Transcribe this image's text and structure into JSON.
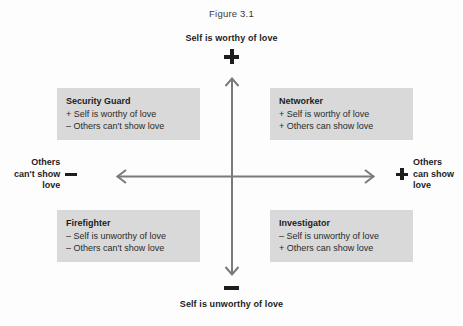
{
  "figure": {
    "title": "Figure 3.1",
    "type": "two-by-two-quadrant-matrix"
  },
  "axes": {
    "vertical": {
      "positive_label": "Self is worthy of love",
      "positive_sign": "+",
      "negative_label": "Self is unworthy of love",
      "negative_sign": "−"
    },
    "horizontal": {
      "negative_sign": "−",
      "negative_label_lines": [
        "Others",
        "can't show",
        "love"
      ],
      "positive_sign": "+",
      "positive_label_lines": [
        "Others",
        "can show",
        "love"
      ]
    }
  },
  "quadrants": [
    {
      "position": "top-left",
      "title": "Security Guard",
      "lines": [
        "+ Self is worthy of love",
        "– Others can't show love"
      ]
    },
    {
      "position": "top-right",
      "title": "Networker",
      "lines": [
        "+ Self is worthy of love",
        "+ Others can show love"
      ]
    },
    {
      "position": "bottom-left",
      "title": "Firefighter",
      "lines": [
        "– Self is unworthy of love",
        "– Others can't show love"
      ]
    },
    {
      "position": "bottom-right",
      "title": "Investigator",
      "lines": [
        "– Self is unworthy of love",
        "+ Others can show love"
      ]
    }
  ],
  "colors": {
    "box_fill": "#d9d9d9",
    "axis_line": "#7a7a7a",
    "text": "#1d1d1d",
    "page_background": "#fdfdfd"
  }
}
